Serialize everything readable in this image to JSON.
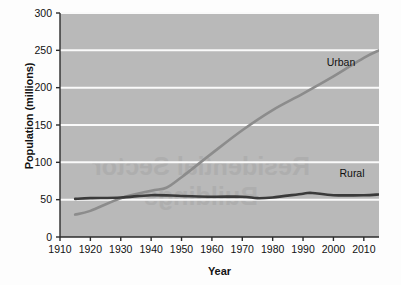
{
  "chart_data": {
    "type": "line",
    "title": "",
    "xlabel": "Year",
    "ylabel": "Population (millions)",
    "xlim": [
      1910,
      2015
    ],
    "ylim": [
      0,
      300
    ],
    "xticks": [
      1910,
      1920,
      1930,
      1940,
      1950,
      1960,
      1970,
      1980,
      1990,
      2000,
      2010
    ],
    "yticks": [
      0,
      50,
      100,
      150,
      200,
      250,
      300
    ],
    "grid": "horizontal",
    "legend_position": "inline-annotation",
    "series": [
      {
        "name": "Urban",
        "color": "#8c8c8c",
        "x": [
          1915,
          1920,
          1930,
          1940,
          1945,
          1950,
          1960,
          1970,
          1980,
          1990,
          2000,
          2010,
          2015
        ],
        "values": [
          30,
          35,
          52,
          62,
          66,
          80,
          112,
          143,
          170,
          192,
          215,
          240,
          250
        ]
      },
      {
        "name": "Rural",
        "color": "#3a3a3a",
        "x": [
          1915,
          1920,
          1930,
          1940,
          1950,
          1960,
          1970,
          1975,
          1980,
          1990,
          1993,
          2000,
          2010,
          2015
        ],
        "values": [
          51,
          52,
          53,
          56,
          55,
          54,
          54,
          52,
          53,
          58,
          59,
          56,
          56,
          57
        ]
      }
    ]
  },
  "axes": {
    "y_title": "Population (millions)",
    "x_title": "Year",
    "y_tick_labels": [
      "300",
      "250",
      "200",
      "150",
      "100",
      "50",
      "0"
    ],
    "x_tick_labels": [
      "1910",
      "1920",
      "1930",
      "1940",
      "1950",
      "1960",
      "1970",
      "1980",
      "1990",
      "2000",
      "2010"
    ]
  },
  "annotations": [
    {
      "name": "urban",
      "label": "Urban"
    },
    {
      "name": "rural",
      "label": "Rural"
    }
  ],
  "watermark": {
    "line1": "Residential Sector",
    "line2": "Buildings"
  },
  "colors": {
    "plot_background": "#b9b9b9",
    "gridline": "#fafafa",
    "axis": "#2b2b2b",
    "urban_line": "#8c8c8c",
    "rural_line": "#3a3a3a",
    "page_background": "#fdfdfd"
  }
}
